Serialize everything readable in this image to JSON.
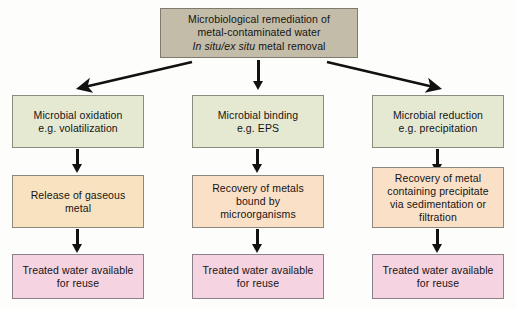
{
  "diagram": {
    "title_box": {
      "line1": "Microbiological remediation of",
      "line2": "metal-contaminated water",
      "line3_italic": "In situ/ex situ",
      "line3_rest": " metal removal"
    },
    "columns": [
      {
        "id": "oxidation",
        "row1": {
          "line1": "Microbial oxidation",
          "line2": "e.g. volatilization"
        },
        "row2": {
          "line1": "Release of gaseous",
          "line2": "metal"
        },
        "row3": {
          "line1": "Treated water available",
          "line2": "for reuse"
        }
      },
      {
        "id": "binding",
        "row1": {
          "line1": "Microbial binding",
          "line2": "e.g. EPS"
        },
        "row2": {
          "line1": "Recovery of metals",
          "line2": "bound by",
          "line3": "microorganisms"
        },
        "row3": {
          "line1": "Treated water available",
          "line2": "for reuse"
        }
      },
      {
        "id": "reduction",
        "row1": {
          "line1": "Microbial reduction",
          "line2": "e.g. precipitation"
        },
        "row2": {
          "line1": "Recovery of metal",
          "line2": "containing precipitate",
          "line3": "via sedimentation or",
          "line4": "filtration"
        },
        "row3": {
          "line1": "Treated water available",
          "line2": "for reuse"
        }
      }
    ],
    "colors": {
      "header_fill": "#c3bca9",
      "stage1_fill": "#e6e9d2",
      "stage2_fill_outer": "#f8e3c0",
      "stage2_fill_middle": "#fbe0c8",
      "stage3_fill": "#f6d3e1",
      "border": "#8c8c84",
      "arrow": "#111111",
      "background": "#fdfdfc"
    }
  }
}
